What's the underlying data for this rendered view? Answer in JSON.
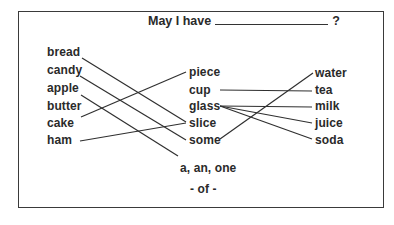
{
  "title": {
    "prefix": "May I have",
    "suffix": "?"
  },
  "columns": {
    "foods": [
      "bread",
      "candy",
      "apple",
      "butter",
      "cake",
      "ham"
    ],
    "measures": [
      "piece",
      "cup",
      "glass",
      "slice",
      "some"
    ],
    "drinks": [
      "water",
      "tea",
      "milk",
      "juice",
      "soda"
    ]
  },
  "footer": {
    "articles": "a, an, one",
    "of": "- of -"
  },
  "connections": [
    {
      "from": "bread",
      "to": "slice"
    },
    {
      "from": "candy",
      "to": "some"
    },
    {
      "from": "apple",
      "to": "a, an, one"
    },
    {
      "from": "cake",
      "to": "piece"
    },
    {
      "from": "ham",
      "to": "slice"
    },
    {
      "from": "cup",
      "to": "tea"
    },
    {
      "from": "glass",
      "to": "milk"
    },
    {
      "from": "glass",
      "to": "juice"
    },
    {
      "from": "glass",
      "to": "soda"
    },
    {
      "from": "some",
      "to": "water"
    }
  ]
}
